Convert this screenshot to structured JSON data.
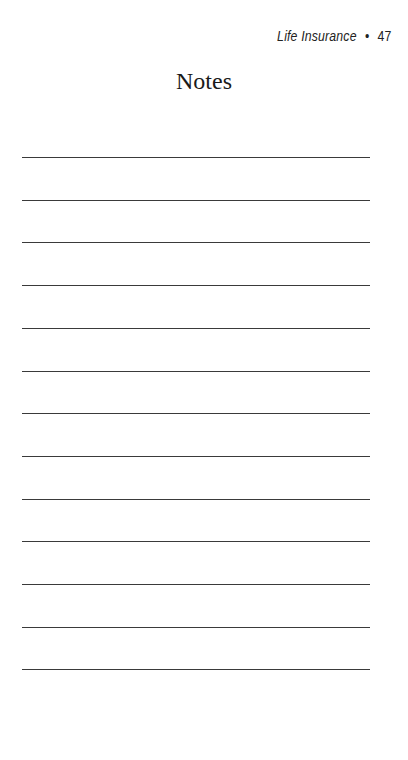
{
  "header": {
    "section": "Life Insurance",
    "separator": "•",
    "page_number": "47"
  },
  "title": "Notes",
  "lines": {
    "count": 13,
    "first_y": 157,
    "spacing": 42.7,
    "color": "#3a3a3a"
  }
}
